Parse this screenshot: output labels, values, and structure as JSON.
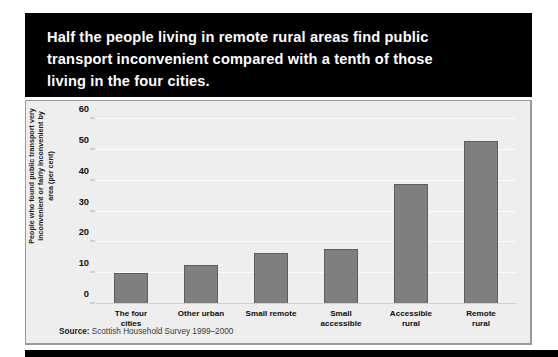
{
  "title": "Half the people living in remote rural areas find public\ntransport inconvenient compared with a tenth of those\nliving in the four cities.",
  "source": {
    "label": "Source:",
    "text": " Scottish Household Survey 1999–2000"
  },
  "colors": {
    "banner_background": "#000000",
    "banner_text": "#ffffff",
    "panel_background": "#eeeeee",
    "bar_fill": "#7f7f7f",
    "bar_border": "#5d5d5d",
    "gridline": "#fbfbfb"
  },
  "chart_data": {
    "type": "bar",
    "title": "Half the people living in remote rural areas find public transport inconvenient compared with a tenth of those living in the four cities.",
    "xlabel": "",
    "ylabel": "People who found public transport very\ninconvenient or fairly inconvenient by\narea (per cent)",
    "categories": [
      "The four\ncities",
      "Other urban",
      "Small remote",
      "Small\naccessible",
      "Accessible\nrural",
      "Remote\nrural"
    ],
    "values": [
      10,
      12.5,
      16.5,
      18,
      39,
      53
    ],
    "ylim": [
      0,
      60
    ],
    "yticks": [
      0,
      10,
      20,
      30,
      40,
      50,
      60
    ],
    "ytick_labels": [
      "0",
      "10",
      "20",
      "30",
      "40",
      "50",
      "60"
    ],
    "grid": true,
    "legend": false
  }
}
